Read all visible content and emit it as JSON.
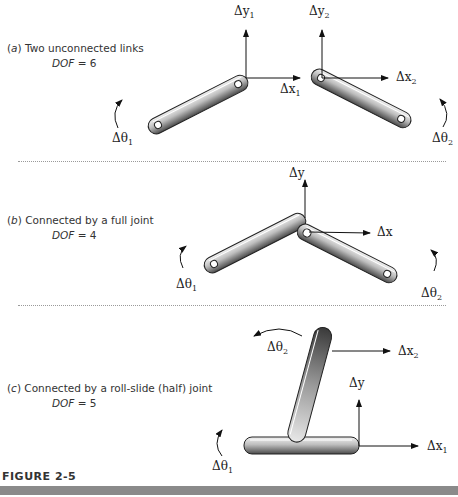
{
  "panels": [
    {
      "id": "a",
      "letter": "a",
      "caption": "Two unconnected links",
      "dof_label": "DOF",
      "dof_value": "= 6",
      "labels": {
        "dy1": "Δy",
        "dy1_sub": "1",
        "dy2": "Δy",
        "dy2_sub": "2",
        "dx1": "Δx",
        "dx1_sub": "1",
        "dx2": "Δx",
        "dx2_sub": "2",
        "dt1": "Δθ",
        "dt1_sub": "1",
        "dt2": "Δθ",
        "dt2_sub": "2"
      }
    },
    {
      "id": "b",
      "letter": "b",
      "caption": "Connected by a full joint",
      "dof_label": "DOF",
      "dof_value": "= 4",
      "labels": {
        "dy": "Δy",
        "dx": "Δx",
        "dt1": "Δθ",
        "dt1_sub": "1",
        "dt2": "Δθ",
        "dt2_sub": "2"
      }
    },
    {
      "id": "c",
      "letter": "c",
      "caption": "Connected by a roll-slide (half) joint",
      "dof_label": "DOF",
      "dof_value": "= 5",
      "labels": {
        "dy": "Δy",
        "dx1": "Δx",
        "dx1_sub": "1",
        "dx2": "Δx",
        "dx2_sub": "2",
        "dt1": "Δθ",
        "dt1_sub": "1",
        "dt2": "Δθ",
        "dt2_sub": "2"
      }
    }
  ],
  "figure": {
    "title": "FIGURE 2-5"
  }
}
